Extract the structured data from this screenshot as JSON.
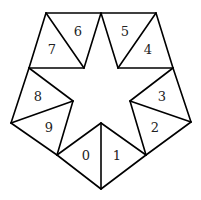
{
  "diagram": {
    "vertices": {
      "top_left": [
        46,
        13
      ],
      "top_center": [
        101,
        13
      ],
      "top_right": [
        156,
        13
      ],
      "upper_left": [
        29,
        68
      ],
      "inner_left_top": [
        84,
        68
      ],
      "inner_right_top": [
        118,
        68
      ],
      "upper_right": [
        173,
        68
      ],
      "inner_left": [
        73,
        101
      ],
      "inner_right": [
        130,
        101
      ],
      "far_left": [
        11,
        123
      ],
      "far_right": [
        191,
        122
      ],
      "inner_bottom": [
        101,
        123
      ],
      "lower_left": [
        57,
        155
      ],
      "lower_right": [
        146,
        155
      ],
      "bottom": [
        101,
        189
      ]
    },
    "triangles": [
      {
        "label": "0",
        "pos": [
          86,
          155
        ]
      },
      {
        "label": "1",
        "pos": [
          117,
          155
        ]
      },
      {
        "label": "2",
        "pos": [
          155,
          127
        ]
      },
      {
        "label": "3",
        "pos": [
          162,
          97
        ]
      },
      {
        "label": "4",
        "pos": [
          148,
          50
        ]
      },
      {
        "label": "5",
        "pos": [
          125,
          32
        ]
      },
      {
        "label": "6",
        "pos": [
          78,
          32
        ]
      },
      {
        "label": "7",
        "pos": [
          52,
          50
        ]
      },
      {
        "label": "8",
        "pos": [
          37,
          97
        ]
      },
      {
        "label": "9",
        "pos": [
          48,
          127
        ]
      }
    ]
  }
}
